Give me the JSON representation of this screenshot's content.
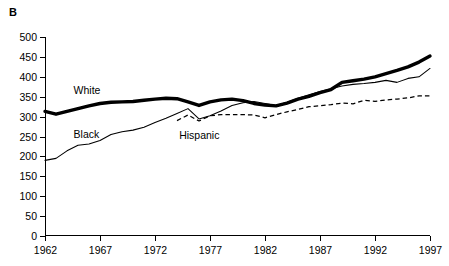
{
  "figure": {
    "panel_label": "B",
    "background_color": "#ffffff",
    "line_color": "#000000"
  },
  "chart_data": {
    "type": "line",
    "title": "",
    "subtitle": "",
    "xlabel": "",
    "ylabel": "",
    "grid": false,
    "legend_position": "inline-annotations",
    "xlim": [
      1962,
      1997
    ],
    "ylim": [
      0,
      500
    ],
    "xticks": [
      1962,
      1967,
      1972,
      1977,
      1982,
      1987,
      1992,
      1997
    ],
    "xtick_labels": [
      "1962",
      "1967",
      "1972",
      "1977",
      "1982",
      "1987",
      "1992",
      "1997"
    ],
    "yticks": [
      0,
      50,
      100,
      150,
      200,
      250,
      300,
      350,
      400,
      450,
      500
    ],
    "ytick_labels": [
      "0",
      "50",
      "100",
      "150",
      "200",
      "250",
      "300",
      "350",
      "400",
      "450",
      "500"
    ],
    "x": [
      1962,
      1963,
      1964,
      1965,
      1966,
      1967,
      1968,
      1969,
      1970,
      1971,
      1972,
      1973,
      1974,
      1975,
      1976,
      1977,
      1978,
      1979,
      1980,
      1981,
      1982,
      1983,
      1984,
      1985,
      1986,
      1987,
      1988,
      1989,
      1990,
      1991,
      1992,
      1993,
      1994,
      1995,
      1996,
      1997
    ],
    "series": [
      {
        "name": "White",
        "style": "thick-solid",
        "annotation": "White",
        "x": [
          1962,
          1963,
          1964,
          1965,
          1966,
          1967,
          1968,
          1969,
          1970,
          1971,
          1972,
          1973,
          1974,
          1975,
          1976,
          1977,
          1978,
          1979,
          1980,
          1981,
          1982,
          1983,
          1984,
          1985,
          1986,
          1987,
          1988,
          1989,
          1990,
          1991,
          1992,
          1993,
          1994,
          1995,
          1996,
          1997
        ],
        "values": [
          313,
          306,
          313,
          320,
          327,
          333,
          336,
          337,
          338,
          341,
          344,
          346,
          345,
          337,
          328,
          337,
          342,
          344,
          340,
          333,
          329,
          327,
          334,
          344,
          351,
          360,
          368,
          386,
          390,
          394,
          400,
          408,
          416,
          425,
          437,
          452
        ]
      },
      {
        "name": "Black",
        "style": "thin-solid",
        "annotation": "Black",
        "x": [
          1962,
          1963,
          1964,
          1965,
          1966,
          1967,
          1968,
          1969,
          1970,
          1971,
          1972,
          1973,
          1974,
          1975,
          1976,
          1977,
          1978,
          1979,
          1980,
          1981,
          1982,
          1983,
          1984,
          1985,
          1986,
          1987,
          1988,
          1989,
          1990,
          1991,
          1992,
          1993,
          1994,
          1995,
          1996,
          1997
        ],
        "values": [
          190,
          195,
          214,
          228,
          231,
          240,
          255,
          262,
          266,
          273,
          285,
          296,
          308,
          320,
          294,
          302,
          314,
          328,
          335,
          338,
          333,
          328,
          336,
          346,
          355,
          363,
          370,
          377,
          381,
          383,
          386,
          391,
          386,
          396,
          400,
          421
        ]
      },
      {
        "name": "Hispanic",
        "style": "dashed",
        "annotation": "Hispanic",
        "start_year": 1974,
        "x": [
          1974,
          1975,
          1976,
          1977,
          1978,
          1979,
          1980,
          1981,
          1982,
          1983,
          1984,
          1985,
          1986,
          1987,
          1988,
          1989,
          1990,
          1991,
          1992,
          1993,
          1994,
          1995,
          1996,
          1997
        ],
        "values": [
          290,
          304,
          289,
          302,
          305,
          305,
          305,
          304,
          297,
          305,
          312,
          318,
          325,
          327,
          330,
          334,
          332,
          341,
          338,
          342,
          344,
          347,
          352,
          352
        ]
      }
    ],
    "annotations": [
      {
        "text": "White",
        "x": 1964.6,
        "y": 357
      },
      {
        "text": "Black",
        "x": 1964.6,
        "y": 247
      },
      {
        "text": "Hispanic",
        "x": 1974.2,
        "y": 243
      }
    ]
  }
}
